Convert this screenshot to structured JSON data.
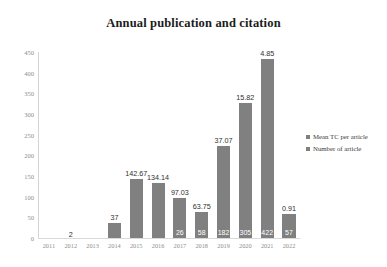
{
  "chart_data": {
    "type": "bar",
    "title": "Annual publication and citation",
    "xlabel": "",
    "ylabel": "",
    "ylim": [
      0,
      450
    ],
    "ytick_step": 50,
    "grid": false,
    "legend_position": "right",
    "categories": [
      "2011",
      "2012",
      "2013",
      "2014",
      "2015",
      "2016",
      "2017",
      "2018",
      "2019",
      "2020",
      "2021",
      "2022"
    ],
    "yticks": [
      "0",
      "50",
      "100",
      "150",
      "200",
      "250",
      "300",
      "350",
      "400",
      "450"
    ],
    "series": [
      {
        "name": "Mean TC per article",
        "label_position": "above-bar",
        "values": [
          0,
          2,
          0,
          37,
          142.67,
          134.14,
          97.03,
          63.75,
          37.07,
          15.82,
          4.85,
          0.91
        ],
        "labels": [
          "",
          "2",
          "",
          "37",
          "142.67",
          "134.14",
          "97.03",
          "63.75",
          "37.07",
          "15.82",
          "4.85",
          "0.91"
        ]
      },
      {
        "name": "Number of article",
        "label_position": "inside-bar",
        "values": [
          0,
          1,
          0,
          3,
          3,
          3,
          26,
          58,
          182,
          305,
          422,
          57
        ],
        "labels": [
          "",
          "",
          "",
          "",
          "",
          "",
          "26",
          "58",
          "182",
          "305",
          "422",
          "57"
        ]
      }
    ],
    "bar_values": [
      0,
      2,
      0,
      37,
      142.67,
      134.14,
      97.03,
      63.75,
      222,
      327,
      432,
      58
    ],
    "bar_color": "#808080"
  },
  "legend": {
    "items": [
      {
        "label": "Mean TC per article",
        "color": "#808080"
      },
      {
        "label": "Number of article",
        "color": "#808080"
      }
    ]
  }
}
